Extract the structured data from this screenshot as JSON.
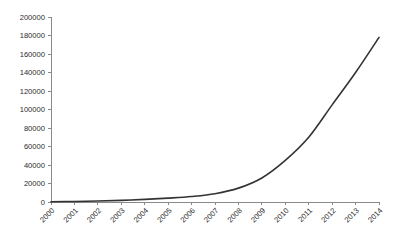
{
  "chart_data": {
    "type": "line",
    "title": "",
    "subtitle": "",
    "xlabel": "",
    "ylabel": "",
    "categories": [
      "2000",
      "2001",
      "2002",
      "2003",
      "2004",
      "2005",
      "2006",
      "2007",
      "2008",
      "2009",
      "2010",
      "2011",
      "2012",
      "2013",
      "2014"
    ],
    "values": [
      300,
      600,
      1100,
      1800,
      2800,
      4200,
      6000,
      9000,
      15000,
      26000,
      45000,
      70000,
      105000,
      140000,
      178000
    ],
    "series": [
      {
        "name": "",
        "values": [
          300,
          600,
          1100,
          1800,
          2800,
          4200,
          6000,
          9000,
          15000,
          26000,
          45000,
          70000,
          105000,
          140000,
          178000
        ]
      }
    ],
    "ylim": [
      0,
      200000
    ],
    "y_ticks": [
      0,
      20000,
      40000,
      60000,
      80000,
      100000,
      120000,
      140000,
      160000,
      180000,
      200000
    ],
    "y_tick_labels": [
      "0",
      "20000",
      "40000",
      "60000",
      "80000",
      "100000",
      "120000",
      "140000",
      "160000",
      "180000",
      "200000"
    ],
    "grid": false,
    "legend": false,
    "legend_position": "none",
    "x_tick_rotation": -45,
    "colors": {
      "line": "#333333",
      "axis": "#8a8a8a",
      "text": "#2b2b2b",
      "background": "#ffffff"
    }
  }
}
